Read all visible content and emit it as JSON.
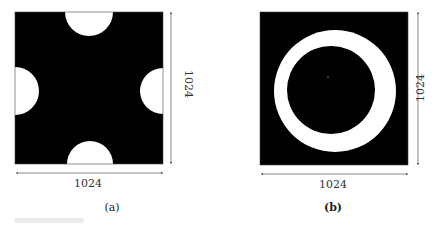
{
  "panels": [
    {
      "id": "a",
      "caption": "(a)",
      "width_label": "1024",
      "height_label": "1024",
      "description": "Black square with four white semicircular cut-outs at the midpoint of each edge (top, bottom, left, right)"
    },
    {
      "id": "b",
      "caption": "(b)",
      "width_label": "1024",
      "height_label": "1024",
      "description": "Black square containing a white annulus (ring) centered in the square"
    }
  ],
  "colors": {
    "background": "#ffffff",
    "mask_dark": "#000000",
    "mask_light": "#ffffff",
    "dimension_line": "#555555"
  }
}
